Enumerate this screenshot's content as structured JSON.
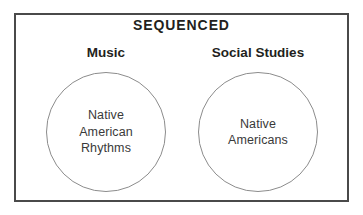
{
  "diagram": {
    "title": "SEQUENCED",
    "type": "two-circle-concept-diagram",
    "columns": [
      {
        "heading": "Music",
        "circle_label_lines": [
          "Native",
          "American",
          "Rhythms"
        ],
        "circle_label_text": "Native American Rhythms"
      },
      {
        "heading": "Social Studies",
        "circle_label_lines": [
          "Native",
          "Americans"
        ],
        "circle_label_text": "Native Americans"
      }
    ],
    "colors": {
      "frame_border": "#4a4a4a",
      "circle_stroke": "#8c8c8c",
      "title_text": "#231f20",
      "heading_text": "#231f20",
      "circle_text": "#3a3a3a",
      "background": "#ffffff"
    }
  }
}
